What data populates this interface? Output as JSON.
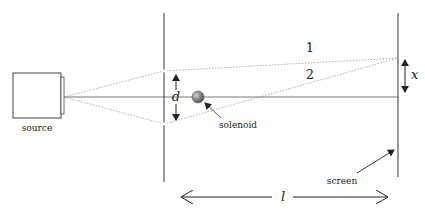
{
  "diagram": {
    "labels": {
      "source": "source",
      "solenoid": "solenoid",
      "screen": "screen",
      "path1": "1",
      "path2": "2",
      "slit_separation": "d",
      "screen_offset": "x",
      "distance": "l"
    },
    "colors": {
      "line": "#333333",
      "dotted": "#888888",
      "solenoid_fill": "#777777"
    }
  }
}
